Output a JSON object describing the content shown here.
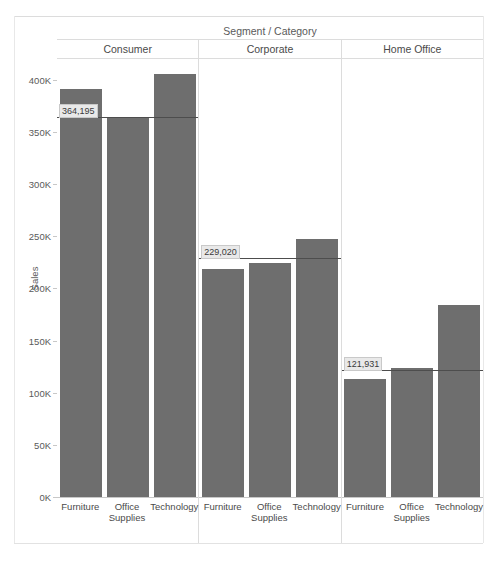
{
  "chart_data": {
    "type": "bar",
    "title": "Segment / Category",
    "xlabel": "",
    "ylabel": "Sales",
    "ylim": [
      0,
      420000
    ],
    "ytick_labels": [
      "400K",
      "350K",
      "300K",
      "250K",
      "200K",
      "150K",
      "100K",
      "50K",
      "0K"
    ],
    "ytick_values": [
      400000,
      350000,
      300000,
      250000,
      200000,
      150000,
      100000,
      50000,
      0
    ],
    "grid": false,
    "legend": "none",
    "categories": [
      "Furniture",
      "Office Supplies",
      "Technology"
    ],
    "panels": [
      {
        "name": "Consumer",
        "values": [
          391000,
          363000,
          406000
        ],
        "reference_line": {
          "label": "364,195",
          "value": 364195
        }
      },
      {
        "name": "Corporate",
        "values": [
          219000,
          224000,
          247000
        ],
        "reference_line": {
          "label": "229,020",
          "value": 229020
        }
      },
      {
        "name": "Home Office",
        "values": [
          113000,
          124000,
          184000
        ],
        "reference_line": {
          "label": "121,931",
          "value": 121931
        }
      }
    ],
    "bar_color": "#6e6e6e",
    "reference_line_color": "#4d4d4d"
  },
  "axis": {
    "y_title": "Sales"
  },
  "category_labels": {
    "furniture": "Furniture",
    "office_supplies_line1": "Office",
    "office_supplies_line2": "Supplies",
    "technology": "Technology"
  }
}
